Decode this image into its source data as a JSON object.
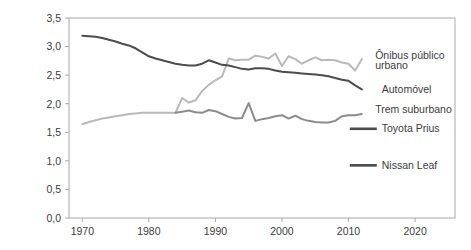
{
  "figure": {
    "axis_label_y": "Energia utilizada (megajoules por passageiro-quilômetro)",
    "axis_label_x": ""
  },
  "chart_data": {
    "type": "line",
    "title": "",
    "xlabel": "",
    "ylabel": "Energia utilizada (megajoules por passageiro-quilômetro)",
    "xlim": [
      1968,
      2026
    ],
    "ylim": [
      0.0,
      3.5
    ],
    "grid": false,
    "legend_position": "inline-right-annotations",
    "yticks": [
      0.0,
      0.5,
      1.0,
      1.5,
      2.0,
      2.5,
      3.0,
      3.5
    ],
    "ytick_labels": [
      "0,0",
      "0,5",
      "1,0",
      "1,5",
      "2,0",
      "2,5",
      "3,0",
      "3,5"
    ],
    "xticks": [
      1970,
      1980,
      1990,
      2000,
      2010,
      2020
    ],
    "xtick_labels": [
      "1970",
      "1980",
      "1990",
      "2000",
      "2010",
      "2020"
    ],
    "series": [
      {
        "name": "Ônibus público urbano",
        "label": "Ônibus público\nurbano",
        "label_line1": "Ônibus público",
        "label_line2": "urbano",
        "color": "#b9b9b9",
        "marker_type": "line",
        "x": [
          1970,
          1971,
          1972,
          1973,
          1974,
          1975,
          1976,
          1977,
          1978,
          1979,
          1980,
          1981,
          1982,
          1983,
          1984,
          1985,
          1986,
          1987,
          1988,
          1989,
          1990,
          1991,
          1992,
          1993,
          1994,
          1995,
          1996,
          1997,
          1998,
          1999,
          2000,
          2001,
          2002,
          2003,
          2004,
          2005,
          2006,
          2007,
          2008,
          2009,
          2010,
          2011,
          2012
        ],
        "y": [
          1.64,
          1.68,
          1.71,
          1.74,
          1.76,
          1.78,
          1.8,
          1.82,
          1.83,
          1.84,
          1.84,
          1.84,
          1.84,
          1.84,
          1.84,
          2.1,
          2.02,
          2.06,
          2.22,
          2.33,
          2.41,
          2.48,
          2.79,
          2.76,
          2.77,
          2.77,
          2.84,
          2.82,
          2.79,
          2.88,
          2.66,
          2.83,
          2.78,
          2.7,
          2.76,
          2.81,
          2.76,
          2.77,
          2.76,
          2.72,
          2.7,
          2.58,
          2.78
        ]
      },
      {
        "name": "Automóvel",
        "label": "Automóvel",
        "color": "#4c4c4c",
        "marker_type": "line",
        "x": [
          1970,
          1971,
          1972,
          1973,
          1974,
          1975,
          1976,
          1977,
          1978,
          1979,
          1980,
          1981,
          1982,
          1983,
          1984,
          1985,
          1986,
          1987,
          1988,
          1989,
          1990,
          1991,
          1992,
          1993,
          1994,
          1995,
          1996,
          1997,
          1998,
          1999,
          2000,
          2001,
          2002,
          2003,
          2004,
          2005,
          2006,
          2007,
          2008,
          2009,
          2010,
          2011,
          2012
        ],
        "y": [
          3.19,
          3.18,
          3.17,
          3.15,
          3.12,
          3.09,
          3.05,
          3.02,
          2.97,
          2.9,
          2.83,
          2.79,
          2.76,
          2.73,
          2.7,
          2.68,
          2.67,
          2.67,
          2.7,
          2.76,
          2.72,
          2.68,
          2.67,
          2.64,
          2.61,
          2.6,
          2.62,
          2.62,
          2.61,
          2.58,
          2.56,
          2.55,
          2.54,
          2.53,
          2.52,
          2.51,
          2.5,
          2.48,
          2.45,
          2.42,
          2.4,
          2.32,
          2.25
        ]
      },
      {
        "name": "Trem suburbano",
        "label": "Trem suburbano",
        "color": "#8c8c8c",
        "marker_type": "line",
        "x": [
          1984,
          1985,
          1986,
          1987,
          1988,
          1989,
          1990,
          1991,
          1992,
          1993,
          1994,
          1995,
          1996,
          1997,
          1998,
          1999,
          2000,
          2001,
          2002,
          2003,
          2004,
          2005,
          2006,
          2007,
          2008,
          2009,
          2010,
          2011,
          2012
        ],
        "y": [
          1.84,
          1.86,
          1.88,
          1.85,
          1.84,
          1.89,
          1.87,
          1.82,
          1.77,
          1.74,
          1.75,
          2.01,
          1.7,
          1.73,
          1.75,
          1.78,
          1.8,
          1.74,
          1.79,
          1.73,
          1.7,
          1.68,
          1.67,
          1.67,
          1.7,
          1.78,
          1.8,
          1.8,
          1.82
        ]
      },
      {
        "name": "Toyota Prius",
        "label": "Toyota Prius",
        "color": "#4c4c4c",
        "marker_type": "swatch",
        "x": [],
        "y": []
      },
      {
        "name": "Nissan Leaf",
        "label": "Nissan Leaf",
        "color": "#4c4c4c",
        "marker_type": "swatch",
        "x": [],
        "y": []
      }
    ],
    "annotations": [
      {
        "text": "Ônibus público",
        "x": 2014,
        "y": 2.78
      },
      {
        "text": "urbano",
        "x": 2014,
        "y": 2.6
      },
      {
        "text": "Automóvel",
        "x": 2015,
        "y": 2.18
      },
      {
        "text": "Trem suburbano",
        "x": 2014,
        "y": 1.84
      },
      {
        "text": "Toyota Prius",
        "x": 2015,
        "y": 1.5
      },
      {
        "text": "Nissan Leaf",
        "x": 2015,
        "y": 0.86
      }
    ]
  }
}
